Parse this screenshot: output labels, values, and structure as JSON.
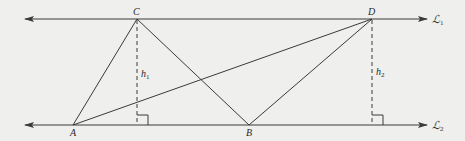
{
  "diagram": {
    "colors": {
      "background": "#efefed",
      "stroke": "#3a3a3a",
      "dashed": "#3a3a3a"
    },
    "lines": {
      "L1": {
        "label": "ℒ",
        "subscript": "1",
        "y": 19
      },
      "L2": {
        "label": "ℒ",
        "subscript": "2",
        "y": 125
      }
    },
    "points": {
      "A": {
        "label": "A",
        "x": 73,
        "y": 125
      },
      "B": {
        "label": "B",
        "x": 249,
        "y": 125
      },
      "C": {
        "label": "C",
        "x": 137,
        "y": 19
      },
      "D": {
        "label": "D",
        "x": 372,
        "y": 19
      }
    },
    "heights": {
      "h1": {
        "label": "h",
        "subscript": "1"
      },
      "h2": {
        "label": "h",
        "subscript": "2"
      }
    },
    "segments": [
      "AC",
      "CB",
      "AD",
      "DB"
    ],
    "perpendiculars": [
      "C to ℒ2",
      "D to ℒ2"
    ]
  }
}
